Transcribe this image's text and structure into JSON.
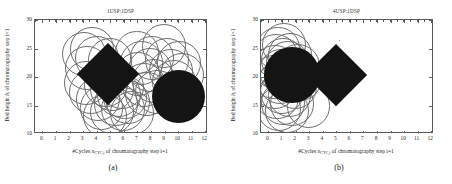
{
  "figure": {
    "caption_a": "(a)",
    "caption_b": "(b)"
  },
  "axes": {
    "xlabel_prefix": "#Cycles ",
    "xlabel_symbol": "n",
    "xlabel_symbol_sub": "CYC,i",
    "xlabel_suffix": " of chromatography step i=1",
    "ylabel_prefix": "Bed height ",
    "ylabel_symbol": "h",
    "ylabel_symbol_sub": "i",
    "ylabel_suffix": " of chromatography step i=1",
    "xticks": [
      0,
      1,
      2,
      3,
      4,
      5,
      6,
      7,
      8,
      9,
      10,
      11,
      12
    ],
    "yticks": [
      10,
      15,
      20,
      25,
      30
    ],
    "xlim": [
      -0.55,
      12.2
    ],
    "ylim": [
      10,
      30
    ]
  },
  "chart_data": [
    {
      "type": "scatter",
      "panel": "a",
      "title": "1USP:1DSP",
      "xlabel": "#Cycles n_CYC,i of chromatography step i=1",
      "ylabel": "Bed height h_i of chromatography step i=1",
      "xlim": [
        -0.55,
        12.2
      ],
      "ylim": [
        10,
        30
      ],
      "grid": false,
      "legend": null,
      "series": [
        {
          "name": "solution-cloud",
          "marker": "open-circle",
          "points": [
            {
              "x": 3.05,
              "y": 24.1,
              "r": 1.62
            },
            {
              "x": 3.62,
              "y": 24.9,
              "r": 1.62
            },
            {
              "x": 4.05,
              "y": 23.3,
              "r": 1.62
            },
            {
              "x": 3.3,
              "y": 21.6,
              "r": 1.62
            },
            {
              "x": 3.18,
              "y": 19.0,
              "r": 1.62
            },
            {
              "x": 3.55,
              "y": 17.4,
              "r": 1.62
            },
            {
              "x": 4.1,
              "y": 16.2,
              "r": 1.62
            },
            {
              "x": 4.35,
              "y": 14.6,
              "r": 1.62
            },
            {
              "x": 4.62,
              "y": 13.2,
              "r": 1.62
            },
            {
              "x": 5.1,
              "y": 13.9,
              "r": 1.62
            },
            {
              "x": 5.4,
              "y": 15.3,
              "r": 1.62
            },
            {
              "x": 5.62,
              "y": 16.8,
              "r": 1.62
            },
            {
              "x": 5.15,
              "y": 17.9,
              "r": 1.62
            },
            {
              "x": 4.7,
              "y": 18.6,
              "r": 1.62
            },
            {
              "x": 5.85,
              "y": 18.3,
              "r": 1.62
            },
            {
              "x": 6.05,
              "y": 16.4,
              "r": 1.62
            },
            {
              "x": 5.95,
              "y": 14.4,
              "r": 1.62
            },
            {
              "x": 6.3,
              "y": 15.6,
              "r": 1.62
            },
            {
              "x": 7.0,
              "y": 24.3,
              "r": 1.62
            },
            {
              "x": 7.3,
              "y": 22.5,
              "r": 1.62
            },
            {
              "x": 7.05,
              "y": 20.5,
              "r": 1.62
            },
            {
              "x": 7.45,
              "y": 18.6,
              "r": 1.62
            },
            {
              "x": 7.7,
              "y": 17.0,
              "r": 1.62
            },
            {
              "x": 7.95,
              "y": 21.2,
              "r": 1.62
            },
            {
              "x": 8.1,
              "y": 23.4,
              "r": 1.62
            },
            {
              "x": 8.25,
              "y": 19.3,
              "r": 1.62
            },
            {
              "x": 8.45,
              "y": 17.3,
              "r": 1.62
            },
            {
              "x": 8.95,
              "y": 25.4,
              "r": 1.62
            },
            {
              "x": 9.2,
              "y": 23.0,
              "r": 1.62
            },
            {
              "x": 9.45,
              "y": 21.0,
              "r": 1.62
            },
            {
              "x": 9.7,
              "y": 19.2,
              "r": 1.62
            },
            {
              "x": 10.05,
              "y": 22.4,
              "r": 1.62
            },
            {
              "x": 10.25,
              "y": 20.3,
              "r": 1.62
            },
            {
              "x": 6.6,
              "y": 13.6,
              "r": 1.62
            },
            {
              "x": 4.95,
              "y": 22.9,
              "r": 1.62
            }
          ]
        },
        {
          "name": "selected-solution-circle",
          "marker": "filled-circle",
          "points": [
            {
              "x": 10.05,
              "y": 16.5,
              "r": 1.95
            }
          ]
        },
        {
          "name": "selected-solution-diamond",
          "marker": "filled-diamond",
          "points": [
            {
              "x": 4.8,
              "y": 20.5,
              "r": 2.05
            }
          ]
        }
      ]
    },
    {
      "type": "scatter",
      "panel": "b",
      "title": "4USP:1DSP",
      "xlabel": "#Cycles n_CYC,i of chromatography step i=1",
      "ylabel": "Bed height h_i of chromatography step i=1",
      "xlim": [
        -0.55,
        12.2
      ],
      "ylim": [
        10,
        30
      ],
      "grid": false,
      "legend": null,
      "series": [
        {
          "name": "solution-cloud",
          "marker": "open-circle",
          "points": [
            {
              "x": 0.7,
              "y": 25.0,
              "r": 1.62
            },
            {
              "x": 1.15,
              "y": 25.6,
              "r": 1.62
            },
            {
              "x": 0.55,
              "y": 23.6,
              "r": 1.62
            },
            {
              "x": 1.05,
              "y": 23.0,
              "r": 1.62
            },
            {
              "x": 1.6,
              "y": 23.8,
              "r": 1.62
            },
            {
              "x": 0.45,
              "y": 21.8,
              "r": 1.62
            },
            {
              "x": 0.95,
              "y": 21.0,
              "r": 1.62
            },
            {
              "x": 0.4,
              "y": 20.0,
              "r": 1.62
            },
            {
              "x": 0.85,
              "y": 19.2,
              "r": 1.62
            },
            {
              "x": 0.5,
              "y": 18.2,
              "r": 1.62
            },
            {
              "x": 1.0,
              "y": 17.4,
              "r": 1.62
            },
            {
              "x": 0.6,
              "y": 16.4,
              "r": 1.62
            },
            {
              "x": 1.1,
              "y": 15.5,
              "r": 1.62
            },
            {
              "x": 0.75,
              "y": 14.4,
              "r": 1.62
            },
            {
              "x": 1.35,
              "y": 14.0,
              "r": 1.62
            },
            {
              "x": 1.75,
              "y": 15.2,
              "r": 1.62
            },
            {
              "x": 1.55,
              "y": 16.8,
              "r": 1.62
            },
            {
              "x": 1.95,
              "y": 18.3,
              "r": 1.62
            },
            {
              "x": 2.2,
              "y": 21.9,
              "r": 1.62
            },
            {
              "x": 2.35,
              "y": 19.6,
              "r": 1.62
            },
            {
              "x": 2.95,
              "y": 14.9,
              "r": 1.62
            },
            {
              "x": 1.3,
              "y": 19.9,
              "r": 1.62
            },
            {
              "x": 1.45,
              "y": 22.5,
              "r": 1.62
            }
          ]
        },
        {
          "name": "selected-solution-circle",
          "marker": "filled-circle",
          "points": [
            {
              "x": 1.72,
              "y": 20.4,
              "r": 2.05
            }
          ]
        },
        {
          "name": "selected-solution-diamond",
          "marker": "filled-diamond",
          "points": [
            {
              "x": 5.0,
              "y": 20.3,
              "r": 2.05
            }
          ]
        }
      ]
    }
  ]
}
